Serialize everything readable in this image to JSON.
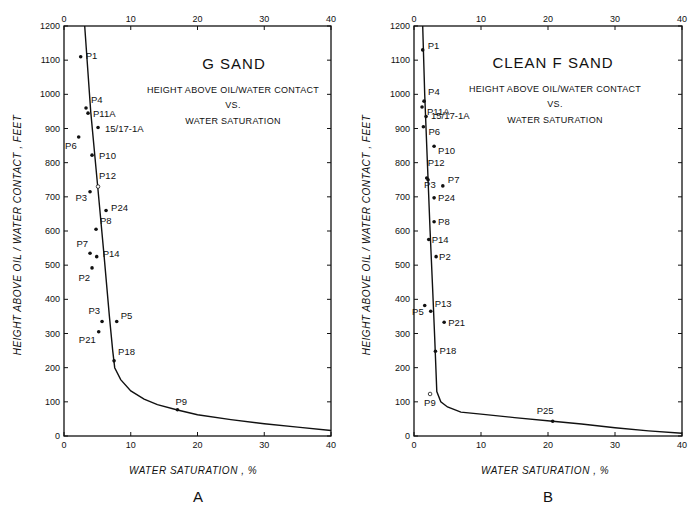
{
  "chart_data": [
    {
      "panel": "A",
      "type": "scatter",
      "title": "G SAND",
      "subtitle": [
        "HEIGHT ABOVE OIL/WATER CONTACT",
        "VS.",
        "WATER SATURATION"
      ],
      "xlabel": "WATER SATURATION , %",
      "ylabel": "HEIGHT ABOVE OIL / WATER CONTACT , FEET",
      "xlim": [
        0,
        40
      ],
      "ylim": [
        0,
        1200
      ],
      "xticks": [
        0,
        10,
        20,
        30,
        40
      ],
      "yticks": [
        0,
        100,
        200,
        300,
        400,
        500,
        600,
        700,
        800,
        900,
        1000,
        1100,
        1200
      ],
      "grid": false,
      "legend": "none",
      "points": [
        {
          "label": "P1",
          "x": 2.5,
          "y": 1110
        },
        {
          "label": "P4",
          "x": 3.3,
          "y": 960
        },
        {
          "label": "P11A",
          "x": 3.6,
          "y": 945
        },
        {
          "label": "15/17-1A",
          "x": 5.1,
          "y": 903
        },
        {
          "label": "P6",
          "x": 2.2,
          "y": 875
        },
        {
          "label": "P10",
          "x": 4.2,
          "y": 822
        },
        {
          "label": "P12",
          "x": 5.1,
          "y": 730,
          "open": true
        },
        {
          "label": "P3",
          "x": 3.9,
          "y": 715
        },
        {
          "label": "P24",
          "x": 6.3,
          "y": 660
        },
        {
          "label": "P8",
          "x": 4.8,
          "y": 605
        },
        {
          "label": "P7",
          "x": 3.9,
          "y": 535
        },
        {
          "label": "P14",
          "x": 4.9,
          "y": 525
        },
        {
          "label": "P2",
          "x": 4.2,
          "y": 492
        },
        {
          "label": "P3",
          "x": 5.7,
          "y": 335
        },
        {
          "label": "P5",
          "x": 7.9,
          "y": 335
        },
        {
          "label": "P21",
          "x": 5.2,
          "y": 305
        },
        {
          "label": "P18",
          "x": 7.5,
          "y": 220
        },
        {
          "label": "P9",
          "x": 17.0,
          "y": 77
        }
      ],
      "curve": {
        "name": "fitted capillary curve",
        "x": [
          3.1,
          4.0,
          5.0,
          6.0,
          6.8,
          7.3,
          7.6,
          8.5,
          10,
          12,
          14,
          17,
          20,
          25,
          30,
          35,
          40
        ],
        "y": [
          1200,
          950,
          740,
          530,
          350,
          250,
          200,
          165,
          132,
          108,
          92,
          76,
          62,
          48,
          36,
          26,
          16
        ]
      },
      "panel_label": "A"
    },
    {
      "panel": "B",
      "type": "scatter",
      "title": "CLEAN F SAND",
      "subtitle": [
        "HEIGHT ABOVE OIL/WATER CONTACT",
        "VS.",
        "WATER SATURATION"
      ],
      "xlabel": "WATER SATURATION , %",
      "ylabel": "HEIGHT ABOVE OIL / WATER CONTACT , FEET",
      "xlim": [
        0,
        40
      ],
      "ylim": [
        0,
        1200
      ],
      "xticks": [
        0,
        10,
        20,
        30,
        40
      ],
      "yticks": [
        0,
        100,
        200,
        300,
        400,
        500,
        600,
        700,
        800,
        900,
        1000,
        1100,
        1200
      ],
      "grid": false,
      "legend": "none",
      "points": [
        {
          "label": "P1",
          "x": 1.3,
          "y": 1130
        },
        {
          "label": "P4",
          "x": 1.5,
          "y": 980
        },
        {
          "label": "P11A",
          "x": 1.2,
          "y": 963
        },
        {
          "label": "15/17-1A",
          "x": 1.8,
          "y": 935
        },
        {
          "label": "P6",
          "x": 1.4,
          "y": 905
        },
        {
          "label": "P10",
          "x": 3.0,
          "y": 848
        },
        {
          "label": "P12",
          "x": 1.9,
          "y": 755
        },
        {
          "label": "P3",
          "x": 2.1,
          "y": 750
        },
        {
          "label": "P7",
          "x": 4.3,
          "y": 732
        },
        {
          "label": "P24",
          "x": 3.0,
          "y": 697
        },
        {
          "label": "P8",
          "x": 3.0,
          "y": 627
        },
        {
          "label": "P14",
          "x": 2.2,
          "y": 575
        },
        {
          "label": "P2",
          "x": 3.3,
          "y": 525
        },
        {
          "label": "P5",
          "x": 1.6,
          "y": 382
        },
        {
          "label": "P13",
          "x": 2.5,
          "y": 365
        },
        {
          "label": "P21",
          "x": 4.5,
          "y": 333
        },
        {
          "label": "P18",
          "x": 3.2,
          "y": 248
        },
        {
          "label": "P9",
          "x": 2.4,
          "y": 123,
          "open": true
        },
        {
          "label": "P25",
          "x": 20.7,
          "y": 43
        }
      ],
      "curve": {
        "name": "fitted capillary curve",
        "x": [
          1.3,
          1.6,
          2.0,
          2.4,
          2.8,
          3.1,
          3.4,
          4.0,
          5.0,
          7.0,
          10,
          15,
          20.7,
          25,
          30,
          35,
          40
        ],
        "y": [
          1200,
          1000,
          800,
          600,
          420,
          280,
          130,
          100,
          85,
          70,
          64,
          54,
          43,
          35,
          24,
          15,
          8
        ]
      },
      "panel_label": "B"
    }
  ]
}
